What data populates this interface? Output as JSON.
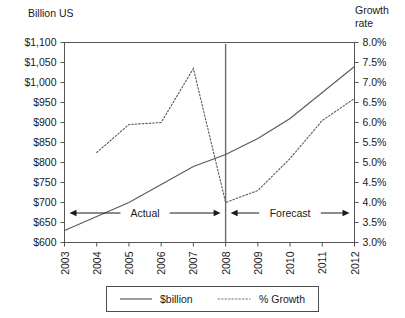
{
  "chart_data": {
    "type": "line",
    "title": "",
    "xlabel": "",
    "ylabel": "Billion US",
    "y2label": "Growth rate",
    "grid": false,
    "legend_position": "bottom",
    "x": [
      2003,
      2004,
      2005,
      2006,
      2007,
      2008,
      2009,
      2010,
      2011,
      2012
    ],
    "categories": [
      "2003",
      "2004",
      "2005",
      "2006",
      "2007",
      "2008",
      "2009",
      "2010",
      "2011",
      "2012"
    ],
    "ylim": [
      600,
      1100
    ],
    "y2lim": [
      3.0,
      8.0
    ],
    "yticks": [
      "$600",
      "$650",
      "$700",
      "$750",
      "$800",
      "$850",
      "$900",
      "$950",
      "$1,000",
      "$1,050",
      "$1,100"
    ],
    "y2ticks": [
      "3.0%",
      "3.5%",
      "4.0%",
      "4.5%",
      "5.0%",
      "5.5%",
      "6.0%",
      "6.5%",
      "7.0%",
      "7.5%",
      "8.0%"
    ],
    "series": [
      {
        "name": "$billion",
        "axis": "left",
        "style": "solid",
        "values": [
          630,
          665,
          700,
          745,
          790,
          820,
          860,
          910,
          975,
          1040
        ]
      },
      {
        "name": "% Growth",
        "axis": "right",
        "style": "dotted",
        "values": [
          null,
          5.25,
          5.95,
          6.0,
          7.35,
          4.0,
          4.3,
          5.1,
          6.05,
          6.6
        ]
      }
    ],
    "annotations": [
      {
        "label": "Actual",
        "from": 2003,
        "to": 2008
      },
      {
        "label": "Forecast",
        "from": 2008,
        "to": 2012
      }
    ],
    "divider_at": 2008
  },
  "axes": {
    "left_title": "Billion US",
    "right_title_line1": "Growth",
    "right_title_line2": "rate"
  },
  "legend": {
    "items": [
      {
        "label": "$billion",
        "style": "solid"
      },
      {
        "label": "% Growth",
        "style": "dotted"
      }
    ]
  }
}
